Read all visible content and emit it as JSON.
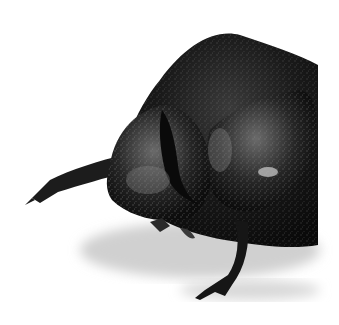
{
  "image": {
    "subject": "black rhinoceros beetle close-up",
    "background": "#ffffff",
    "colors": {
      "body": "#141414",
      "highlight": "#9a9a9a",
      "shadow": "#c8c8c8"
    }
  }
}
